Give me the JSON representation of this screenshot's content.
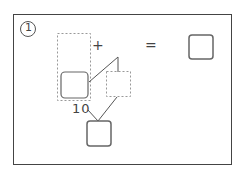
{
  "problem": {
    "number_label": "1",
    "plus": "+",
    "equals": "=",
    "ten_label": "10"
  },
  "colors": {
    "frame": "#444444",
    "box_stroke": "#666666",
    "dashed_stroke": "#999999"
  }
}
